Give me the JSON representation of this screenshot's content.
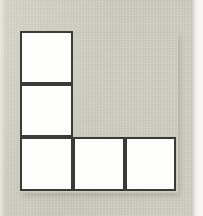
{
  "image": {
    "title": "L-shaped polyomino figure",
    "width": 203,
    "height": 216,
    "background_color": "#cecdc1",
    "edge_band_color": "#f8f7f3"
  },
  "figure": {
    "name": "V-pentomino",
    "square_count": 5,
    "fill_color": "#fdfdfb",
    "stroke_color": "#3a3a36",
    "stroke_width_px": 2,
    "cell_size_px": 53,
    "origin": {
      "x": 20,
      "y": 31
    },
    "grid_columns": 3,
    "grid_rows": 3,
    "occupied_cells": [
      {
        "id": "cell-r0c0",
        "label": "top-left",
        "row": 0,
        "col": 0,
        "x": 20,
        "y": 31,
        "w": 53,
        "h": 53
      },
      {
        "id": "cell-r1c0",
        "label": "middle-left",
        "row": 1,
        "col": 0,
        "x": 20,
        "y": 84,
        "w": 53,
        "h": 53
      },
      {
        "id": "cell-r2c0",
        "label": "bottom-left-corner",
        "row": 2,
        "col": 0,
        "x": 20,
        "y": 137,
        "w": 53,
        "h": 54
      },
      {
        "id": "cell-r2c1",
        "label": "bottom-middle",
        "row": 2,
        "col": 1,
        "x": 73,
        "y": 137,
        "w": 52,
        "h": 54
      },
      {
        "id": "cell-r2c2",
        "label": "bottom-right",
        "row": 2,
        "col": 2,
        "x": 125,
        "y": 137,
        "w": 51,
        "h": 54
      }
    ]
  }
}
